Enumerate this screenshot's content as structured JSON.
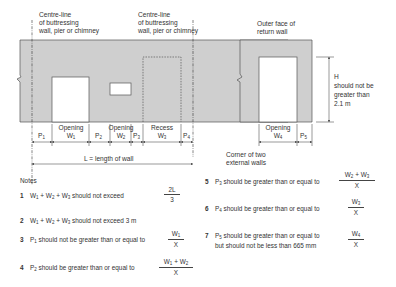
{
  "labels": {
    "centre_line_left": [
      "Centre-line",
      "of buttressing",
      "wall, pier or chimney"
    ],
    "centre_line_right": [
      "Centre-line",
      "of buttressing",
      "wall, pier or chimney"
    ],
    "outer_face": [
      "Outer face of",
      "return wall"
    ],
    "height_note": [
      "H",
      "should not be",
      "greater than",
      "2.1 m"
    ],
    "corner_note": [
      "Corner of two",
      "external walls"
    ],
    "length_label": "L  =  length of wall"
  },
  "dimensions": {
    "main": [
      {
        "name": "P1",
        "top": "",
        "bottom": "P1"
      },
      {
        "name": "W1",
        "top": "Opening",
        "bottom": "W1"
      },
      {
        "name": "P2",
        "top": "",
        "bottom": "P2"
      },
      {
        "name": "W2",
        "top": "Opening",
        "bottom": "W2"
      },
      {
        "name": "P3",
        "top": "",
        "bottom": "P3"
      },
      {
        "name": "W3",
        "top": "Recess",
        "bottom": "W3"
      },
      {
        "name": "P4",
        "top": "",
        "bottom": "P4"
      }
    ],
    "return": [
      {
        "name": "W4",
        "top": "Opening",
        "bottom": "W4"
      },
      {
        "name": "P5",
        "top": "",
        "bottom": "P5"
      }
    ]
  },
  "notes": {
    "title": "Notes",
    "items": [
      {
        "num": "1",
        "text": "W1 + W2 + W3 should not exceed",
        "frac_top": "2L",
        "frac_bot": "3"
      },
      {
        "num": "2",
        "text": "W1 + W2 + W3 should not exceed 3 m"
      },
      {
        "num": "3",
        "text": "P1 should not be greater than or equal to",
        "frac_top": "W1",
        "frac_bot": "X"
      },
      {
        "num": "4",
        "text": "P2 should be greater than or equal to",
        "frac_top": "W1 + W2",
        "frac_bot": "X"
      },
      {
        "num": "5",
        "text": "P3 should be greater than or equal to",
        "frac_top": "W2 + W3",
        "frac_bot": "X"
      },
      {
        "num": "6",
        "text": "P4 should be greater than or equal to",
        "frac_top": "W3",
        "frac_bot": "X"
      },
      {
        "num": "7",
        "text": "P5 should be greater than or equal to",
        "text2": "but should not be less than 665 mm",
        "frac_top": "W4",
        "frac_bot": "X"
      }
    ]
  },
  "colors": {
    "wall_fill": "#cfcfcf",
    "wall_stroke": "#555555",
    "line": "#333333"
  }
}
